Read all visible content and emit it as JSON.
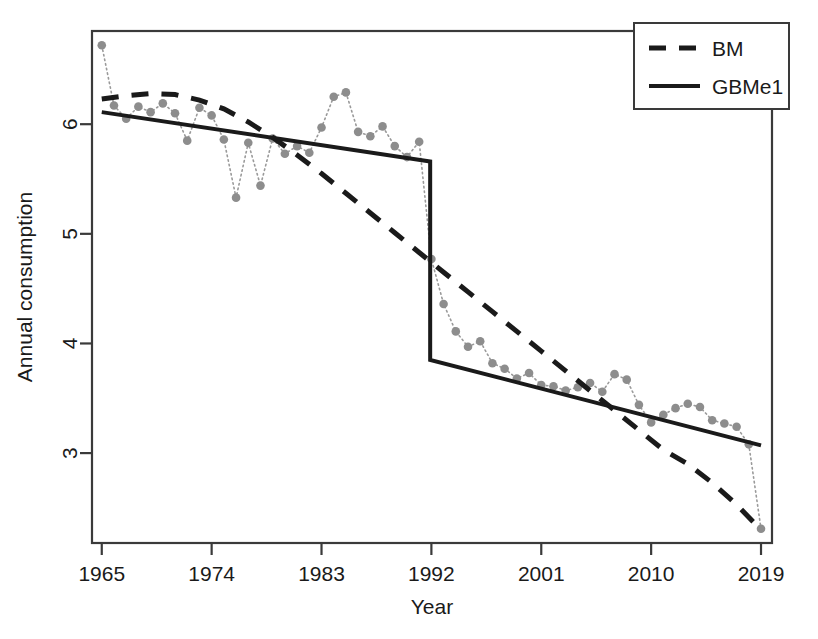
{
  "chart_data": {
    "type": "line",
    "title": "",
    "xlabel": "Year",
    "ylabel": "Annual consumption",
    "xlim": [
      1964.2,
      2019.9
    ],
    "ylim": [
      2.18,
      6.85
    ],
    "xticks": [
      1965,
      1974,
      1983,
      1992,
      2001,
      2010,
      2019
    ],
    "xtick_labels": [
      "1965",
      "1974",
      "1983",
      "1992",
      "2001",
      "2010",
      "2019"
    ],
    "yticks": [
      3,
      4,
      5,
      6
    ],
    "ytick_labels": [
      "3",
      "4",
      "5",
      "6"
    ],
    "grid": false,
    "legend_position": "top-right",
    "legend": [
      {
        "name": "BM",
        "style": "dashed",
        "color": "#1a1a1a"
      },
      {
        "name": "GBMe1",
        "style": "solid",
        "color": "#1a1a1a"
      }
    ],
    "observed": {
      "name": "Observed annual consumption",
      "style": "dotted-with-points",
      "color": "#8d8d8d",
      "x": [
        1965,
        1966,
        1967,
        1968,
        1969,
        1970,
        1971,
        1972,
        1973,
        1974,
        1975,
        1976,
        1977,
        1978,
        1979,
        1980,
        1981,
        1982,
        1983,
        1984,
        1985,
        1986,
        1987,
        1988,
        1989,
        1990,
        1991,
        1992,
        1993,
        1994,
        1995,
        1996,
        1997,
        1998,
        1999,
        2000,
        2001,
        2002,
        2003,
        2004,
        2005,
        2006,
        2007,
        2008,
        2009,
        2010,
        2011,
        2012,
        2013,
        2014,
        2015,
        2016,
        2017,
        2018,
        2019
      ],
      "y": [
        6.72,
        6.17,
        6.05,
        6.16,
        6.11,
        6.19,
        6.1,
        5.85,
        6.15,
        6.08,
        5.86,
        5.33,
        5.83,
        5.44,
        5.87,
        5.73,
        5.8,
        5.74,
        5.97,
        6.25,
        6.29,
        5.93,
        5.89,
        5.98,
        5.8,
        5.7,
        5.84,
        4.77,
        4.36,
        4.11,
        3.97,
        4.02,
        3.82,
        3.77,
        3.68,
        3.73,
        3.62,
        3.61,
        3.57,
        3.6,
        3.64,
        3.56,
        3.72,
        3.67,
        3.44,
        3.28,
        3.35,
        3.41,
        3.45,
        3.42,
        3.3,
        3.27,
        3.24,
        3.08,
        2.31
      ]
    },
    "series": [
      {
        "name": "BM",
        "style": "dashed",
        "color": "#1a1a1a",
        "description": "Smooth bass-model style curve, gradually steepening decline",
        "x": [
          1965,
          1967,
          1969,
          1971,
          1973,
          1975,
          1977,
          1979,
          1981,
          1983,
          1985,
          1987,
          1989,
          1991,
          1993,
          1995,
          1997,
          1999,
          2001,
          2003,
          2005,
          2007,
          2009,
          2011,
          2013,
          2015,
          2017,
          2019
        ],
        "y": [
          6.23,
          6.26,
          6.28,
          6.27,
          6.22,
          6.14,
          6.02,
          5.88,
          5.72,
          5.55,
          5.37,
          5.19,
          5.01,
          4.83,
          4.65,
          4.47,
          4.29,
          4.11,
          3.93,
          3.75,
          3.57,
          3.39,
          3.21,
          3.03,
          2.9,
          2.73,
          2.53,
          2.3
        ]
      },
      {
        "name": "GBMe1",
        "style": "solid",
        "color": "#1a1a1a",
        "description": "Piecewise linear with a sharp downward step shock at 1991.9",
        "breakpoint": 1991.9,
        "pre_break": {
          "x": [
            1965,
            1991.9
          ],
          "y": [
            6.11,
            5.66
          ]
        },
        "step": {
          "x": 1991.9,
          "y_from": 5.66,
          "y_to": 3.85
        },
        "post_break": {
          "x": [
            1991.9,
            2019
          ],
          "y": [
            3.85,
            3.07
          ]
        }
      }
    ]
  },
  "axes": {
    "x_title": "Year",
    "y_title": "Annual consumption"
  },
  "legend_panel": {
    "items": [
      {
        "key": "dashed",
        "label": "BM"
      },
      {
        "key": "solid",
        "label": "GBMe1"
      }
    ]
  }
}
